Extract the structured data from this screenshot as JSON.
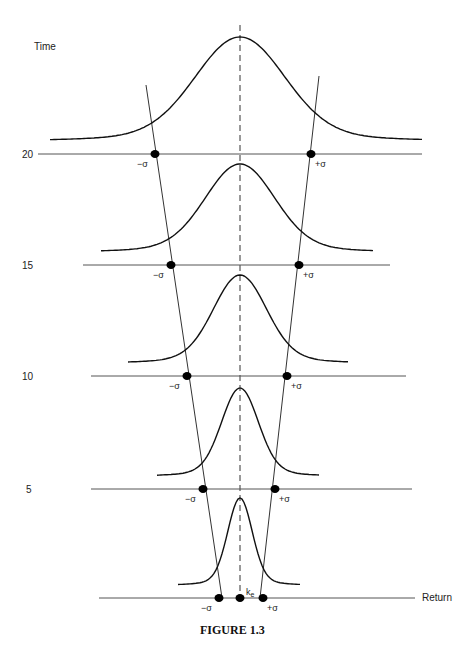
{
  "figure": {
    "caption": "FIGURE 1.3",
    "y_axis_label": "Time",
    "x_axis_label": "Return",
    "mean_label": "k",
    "mean_subscript": "e",
    "minus_sigma_label": "−σ",
    "plus_sigma_label": "+σ",
    "time_levels": [
      {
        "label": "20",
        "y": 154,
        "line_x1": 38,
        "line_x2": 422,
        "label_x": 22,
        "minus_x": 155,
        "plus_x": 311,
        "curve_x1": 50,
        "curve_x2": 422,
        "peak_y": 37,
        "spread": 44
      },
      {
        "label": "15",
        "y": 265,
        "line_x1": 83,
        "line_x2": 390,
        "label_x": 22,
        "minus_x": 171,
        "plus_x": 299,
        "curve_x1": 101,
        "curve_x2": 373,
        "peak_y": 164,
        "spread": 34
      },
      {
        "label": "10",
        "y": 376,
        "line_x1": 91,
        "line_x2": 406,
        "label_x": 22,
        "minus_x": 187,
        "plus_x": 287,
        "curve_x1": 128,
        "curve_x2": 348,
        "peak_y": 275,
        "spread": 26
      },
      {
        "label": "5",
        "y": 489,
        "line_x1": 91,
        "line_x2": 412,
        "label_x": 26,
        "minus_x": 203,
        "plus_x": 275,
        "curve_x1": 157,
        "curve_x2": 320,
        "peak_y": 388,
        "spread": 18
      },
      {
        "label": "",
        "y": 598,
        "line_x1": 99,
        "line_x2": 415,
        "label_x": 0,
        "minus_x": 219,
        "plus_x": 263,
        "curve_x1": 178,
        "curve_x2": 300,
        "peak_y": 498,
        "spread": 12
      }
    ],
    "mean_x": 240
  },
  "chart_data": {
    "type": "line",
    "title": "FIGURE 1.3",
    "xlabel": "Return",
    "ylabel": "Time",
    "x": [
      "-σ",
      "k_e",
      "+σ"
    ],
    "series": [
      {
        "name": "time 0 (Return axis)",
        "minus_sigma_offset": -21,
        "plus_sigma_offset": 23
      },
      {
        "name": "time 5",
        "minus_sigma_offset": -37,
        "plus_sigma_offset": 35
      },
      {
        "name": "time 10",
        "minus_sigma_offset": -53,
        "plus_sigma_offset": 47
      },
      {
        "name": "time 15",
        "minus_sigma_offset": -69,
        "plus_sigma_offset": 59
      },
      {
        "name": "time 20",
        "minus_sigma_offset": -85,
        "plus_sigma_offset": 71
      }
    ],
    "y_ticks": [
      "5",
      "10",
      "15",
      "20"
    ],
    "grid": false
  }
}
